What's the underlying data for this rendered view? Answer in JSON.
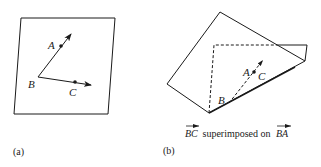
{
  "figure": {
    "panel_a": {
      "label": "(a)",
      "points": {
        "A": "A",
        "B": "B",
        "C": "C"
      }
    },
    "panel_b": {
      "label": "(b)",
      "points": {
        "A": "A",
        "B": "B",
        "C": "C"
      },
      "caption": {
        "vec1": "BC",
        "middle": " superimposed on ",
        "vec2": "BA"
      }
    },
    "colors": {
      "stroke": "#1a1a1a",
      "background": "#ffffff"
    }
  }
}
